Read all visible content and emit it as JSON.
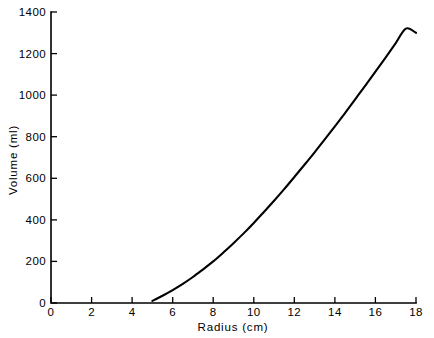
{
  "chart_data": {
    "type": "line",
    "title": "",
    "xlabel": "Radius  (cm)",
    "ylabel": "Volume  (ml)",
    "xlim": [
      0,
      18
    ],
    "ylim": [
      0,
      1400
    ],
    "xticks": [
      0,
      2,
      4,
      6,
      8,
      10,
      12,
      14,
      16,
      18
    ],
    "xtick_labels": [
      "0",
      "2",
      "4",
      "6",
      "8",
      "10",
      "12",
      "14",
      "16",
      "18"
    ],
    "yticks": [
      0,
      200,
      400,
      600,
      800,
      1000,
      1200,
      1400
    ],
    "ytick_labels": [
      "0",
      "200",
      "400",
      "600",
      "800",
      "1000",
      "1200",
      "1400"
    ],
    "grid": false,
    "legend": null,
    "series": [
      {
        "name": "volume-vs-radius",
        "color": "#000000",
        "x": [
          5.0,
          5.5,
          6.0,
          6.5,
          7.0,
          7.5,
          8.0,
          8.5,
          9.0,
          9.5,
          10.0,
          10.5,
          11.0,
          11.5,
          12.0,
          12.5,
          13.0,
          13.5,
          14.0,
          14.5,
          15.0,
          15.5,
          16.0,
          16.5,
          17.0,
          17.5,
          18.0
        ],
        "y": [
          10,
          35,
          62,
          92,
          125,
          162,
          200,
          243,
          288,
          335,
          385,
          438,
          492,
          548,
          606,
          665,
          725,
          787,
          850,
          914,
          980,
          1046,
          1113,
          1181,
          1250,
          1320,
          1300
        ]
      }
    ]
  },
  "axes": {
    "x_title": "Radius  (cm)",
    "y_title": "Volume  (ml)"
  }
}
